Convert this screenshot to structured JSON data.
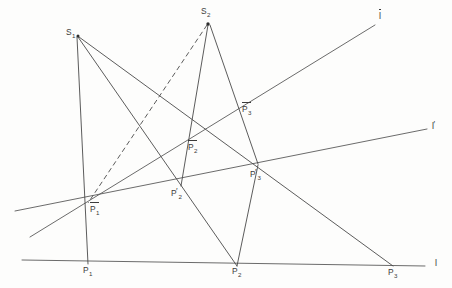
{
  "figure": {
    "background_color": "#fdfdfc",
    "stroke_color": "#4a4a4a",
    "width": 452,
    "height": 288
  },
  "centers": [
    {
      "id": "S1",
      "label": "S",
      "subscript": "1",
      "x": 77,
      "y": 35,
      "bar": false,
      "prime": false
    },
    {
      "id": "S2",
      "label": "S",
      "subscript": "2",
      "x": 208,
      "y": 22,
      "bar": false,
      "prime": false
    }
  ],
  "lines": [
    {
      "id": "l",
      "label": "l",
      "bar": false,
      "prime": false,
      "x1": 22,
      "y1": 260,
      "x2": 425,
      "y2": 266,
      "label_x": 435,
      "label_y": 259,
      "style": "solid"
    },
    {
      "id": "l_prime",
      "label": "l",
      "bar": false,
      "prime": true,
      "x1": 15,
      "y1": 211,
      "x2": 427,
      "y2": 129,
      "label_x": 432,
      "label_y": 122,
      "style": "solid"
    },
    {
      "id": "l_bar",
      "label": "l",
      "bar": true,
      "prime": false,
      "x1": 30,
      "y1": 237,
      "x2": 375,
      "y2": 25,
      "label_x": 379,
      "label_y": 12,
      "style": "solid"
    }
  ],
  "points": [
    {
      "id": "P1",
      "label": "P",
      "subscript": "1",
      "bar": false,
      "prime": false,
      "x": 88,
      "y": 262,
      "label_x": 83,
      "label_y": 266,
      "on_line": "l"
    },
    {
      "id": "P2",
      "label": "P",
      "subscript": "2",
      "bar": false,
      "prime": false,
      "x": 236,
      "y": 264,
      "label_x": 232,
      "label_y": 267,
      "on_line": "l"
    },
    {
      "id": "P3",
      "label": "P",
      "subscript": "3",
      "bar": false,
      "prime": false,
      "x": 392,
      "y": 265,
      "label_x": 388,
      "label_y": 268,
      "on_line": "l"
    },
    {
      "id": "P1p",
      "label": "P",
      "subscript": "1",
      "bar": true,
      "prime": false,
      "x": 87,
      "y": 203,
      "label_x": 90,
      "label_y": 205,
      "on_line": "l_prime"
    },
    {
      "id": "P2p",
      "label": "P",
      "subscript": "2",
      "bar": false,
      "prime": true,
      "x": 182,
      "y": 185,
      "label_x": 171,
      "label_y": 189,
      "on_line": "l_prime"
    },
    {
      "id": "P3p",
      "label": "P",
      "subscript": "3",
      "bar": false,
      "prime": true,
      "x": 257,
      "y": 164,
      "label_x": 250,
      "label_y": 170,
      "on_line": "l_prime"
    },
    {
      "id": "P2bar",
      "label": "P",
      "subscript": "2",
      "bar": true,
      "prime": false,
      "x": 192,
      "y": 143,
      "label_x": 188,
      "label_y": 143,
      "on_line": "l_bar"
    },
    {
      "id": "P3bar",
      "label": "P",
      "subscript": "3",
      "bar": true,
      "prime": false,
      "x": 243,
      "y": 107,
      "label_x": 242,
      "label_y": 105,
      "on_line": "l_bar"
    }
  ],
  "rays": [
    {
      "id": "S1-P1",
      "from": "S1",
      "to": "P1",
      "x1": 77,
      "y1": 37,
      "x2": 88,
      "y2": 264,
      "style": "solid"
    },
    {
      "id": "S1-P2",
      "from": "S1",
      "to": "P2",
      "x1": 78,
      "y1": 37,
      "x2": 237,
      "y2": 266,
      "style": "solid"
    },
    {
      "id": "S1-P3",
      "from": "S1",
      "to": "P3",
      "x1": 79,
      "y1": 37,
      "x2": 393,
      "y2": 266,
      "style": "solid"
    },
    {
      "id": "S2-P1bar-dashed",
      "from": "S2",
      "to": "P1bar",
      "x1": 207,
      "y1": 25,
      "x2": 88,
      "y2": 203,
      "style": "dashed"
    },
    {
      "id": "S2-P2p",
      "from": "S2",
      "to": "P2p",
      "x1": 208,
      "y1": 25,
      "x2": 181,
      "y2": 186,
      "style": "solid"
    },
    {
      "id": "S2-P3p",
      "from": "S2",
      "to": "P3p",
      "x1": 210,
      "y1": 25,
      "x2": 258,
      "y2": 164,
      "style": "solid"
    },
    {
      "id": "P3p-P2-ext",
      "from": "P3p",
      "to": "P2",
      "x1": 258,
      "y1": 165,
      "x2": 237,
      "y2": 266,
      "style": "solid"
    }
  ],
  "legend_note": ""
}
